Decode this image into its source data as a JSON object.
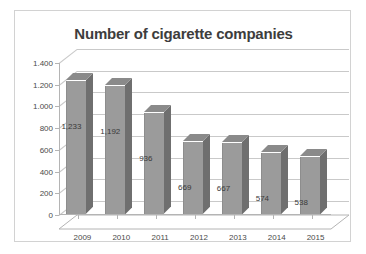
{
  "chart_data": {
    "type": "bar",
    "title": "Number of cigarette companies",
    "xlabel": "",
    "ylabel": "",
    "categories": [
      "2009",
      "2010",
      "2011",
      "2012",
      "2013",
      "2014",
      "2015"
    ],
    "values": [
      1233,
      1192,
      936,
      669,
      667,
      574,
      538
    ],
    "value_labels": [
      "1,233",
      "1,192",
      "936",
      "669",
      "667",
      "574",
      "538"
    ],
    "ylim": [
      0,
      1400
    ],
    "ytick_values": [
      0,
      200,
      400,
      600,
      800,
      1000,
      1200,
      1400
    ],
    "ytick_labels": [
      "0",
      "200",
      "400",
      "600",
      "800",
      "1.000",
      "1.200",
      "1.400"
    ],
    "grid": true,
    "legend": "none",
    "style": "3d-column",
    "colors": {
      "bar_front": "#9b9b9b",
      "bar_side": "#6f6f6f",
      "bar_top": "#8a8a8a",
      "gridline": "#c9c9c9",
      "axis": "#b4b4b4",
      "title_text": "#3d3d3d",
      "tick_text": "#4a4a4a",
      "frame_border": "#d2d2d2",
      "background": "#ffffff"
    }
  }
}
